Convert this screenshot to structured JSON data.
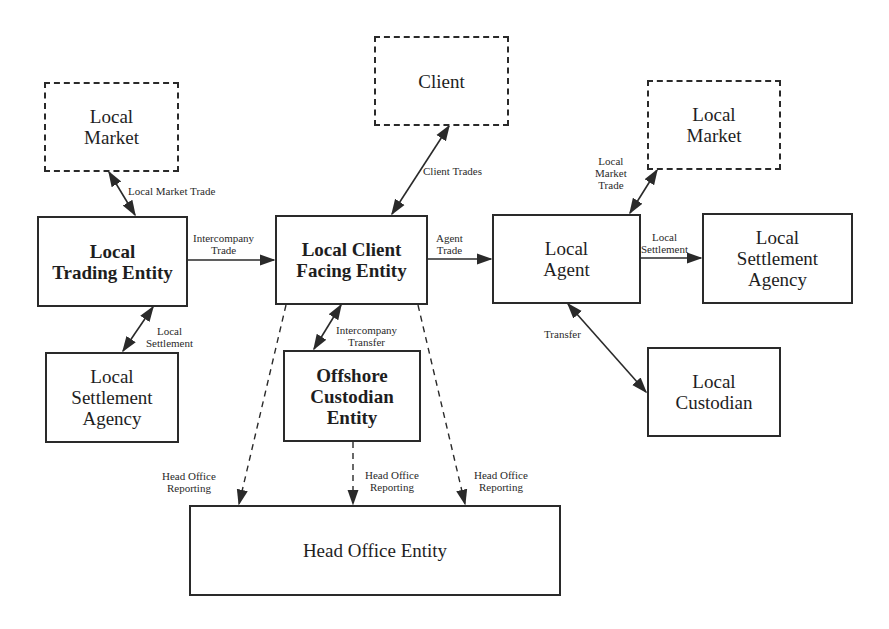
{
  "diagram": {
    "nodes": {
      "local_market_left": {
        "label": "Local\nMarket",
        "style": "dashed"
      },
      "client": {
        "label": "Client",
        "style": "dashed"
      },
      "local_market_right": {
        "label": "Local\nMarket",
        "style": "dashed"
      },
      "local_trading_entity": {
        "label": "Local\nTrading Entity",
        "style": "solid-bold"
      },
      "local_client_facing_entity": {
        "label": "Local Client\nFacing Entity",
        "style": "solid-bold"
      },
      "local_agent": {
        "label": "Local\nAgent",
        "style": "solid"
      },
      "local_settlement_agency_right": {
        "label": "Local\nSettlement\nAgency",
        "style": "solid"
      },
      "local_settlement_agency_left": {
        "label": "Local\nSettlement\nAgency",
        "style": "solid"
      },
      "offshore_custodian_entity": {
        "label": "Offshore\nCustodian\nEntity",
        "style": "solid-bold"
      },
      "local_custodian": {
        "label": "Local\nCustodian",
        "style": "solid"
      },
      "head_office_entity": {
        "label": "Head Office Entity",
        "style": "solid"
      }
    },
    "edges": {
      "local_market_trade_left": {
        "label": "Local Market Trade",
        "from": "local_market_left",
        "to": "local_trading_entity",
        "type": "bidirectional"
      },
      "intercompany_trade": {
        "label": "Intercompany\nTrade",
        "from": "local_trading_entity",
        "to": "local_client_facing_entity",
        "type": "directed"
      },
      "client_trades": {
        "label": "Client Trades",
        "from": "client",
        "to": "local_client_facing_entity",
        "type": "bidirectional"
      },
      "agent_trade": {
        "label": "Agent\nTrade",
        "from": "local_client_facing_entity",
        "to": "local_agent",
        "type": "directed"
      },
      "local_market_trade_right": {
        "label": "Local\nMarket\nTrade",
        "from": "local_agent",
        "to": "local_market_right",
        "type": "bidirectional"
      },
      "local_settlement_right": {
        "label": "Local\nSettlement",
        "from": "local_agent",
        "to": "local_settlement_agency_right",
        "type": "directed"
      },
      "local_settlement_left": {
        "label": "Local\nSettlement",
        "from": "local_trading_entity",
        "to": "local_settlement_agency_left",
        "type": "bidirectional"
      },
      "intercompany_transfer": {
        "label": "Intercompany\nTransfer",
        "from": "local_client_facing_entity",
        "to": "offshore_custodian_entity",
        "type": "bidirectional"
      },
      "transfer": {
        "label": "Transfer",
        "from": "local_agent",
        "to": "local_custodian",
        "type": "bidirectional"
      },
      "head_office_reporting_left": {
        "label": "Head Office\nReporting",
        "from": "local_client_facing_entity",
        "to": "head_office_entity",
        "type": "dashed-directed"
      },
      "head_office_reporting_middle": {
        "label": "Head Office\nReporting",
        "from": "offshore_custodian_entity",
        "to": "head_office_entity",
        "type": "dashed-directed"
      },
      "head_office_reporting_right": {
        "label": "Head Office\nReporting",
        "from": "local_client_facing_entity",
        "to": "head_office_entity",
        "type": "dashed-directed"
      }
    }
  },
  "colors": {
    "stroke": "#2a2a2a",
    "background": "#ffffff"
  }
}
